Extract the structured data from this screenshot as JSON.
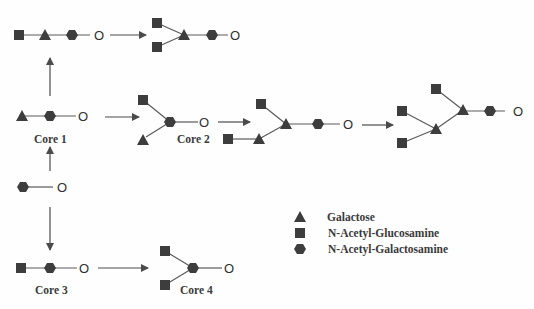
{
  "colors": {
    "symbol": "#3d3d3d",
    "line": "#5a5a5a",
    "text": "#3a3a3a",
    "background": "#fefefe"
  },
  "cores": {
    "core1": "Core 1",
    "core2": "Core 2",
    "core3": "Core 3",
    "core4": "Core 4"
  },
  "anchor_label": "O",
  "legend": {
    "items": [
      {
        "icon": "triangle",
        "label": "Galactose"
      },
      {
        "icon": "square",
        "label": "N-Acetyl-Glucosamine"
      },
      {
        "icon": "hexagon",
        "label": "N-Acetyl-Galactosamine"
      }
    ]
  }
}
